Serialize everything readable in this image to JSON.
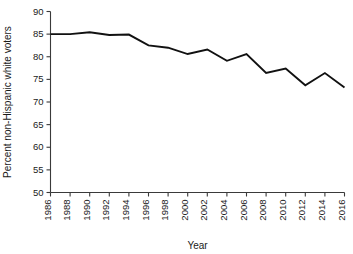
{
  "chart_data": {
    "type": "line",
    "title": "",
    "subtitle": "",
    "xlabel": "Year",
    "ylabel": "Percent non-Hispanic white voters",
    "xlim": [
      1986,
      2016
    ],
    "ylim": [
      50,
      90
    ],
    "grid": false,
    "legend": null,
    "legend_position": "none",
    "x_tick_labels": [
      "1986",
      "1988",
      "1990",
      "1992",
      "1994",
      "1996",
      "1998",
      "2000",
      "2002",
      "2004",
      "2006",
      "2008",
      "2010",
      "2012",
      "2014",
      "2016"
    ],
    "y_tick_labels": [
      "50",
      "55",
      "60",
      "65",
      "70",
      "75",
      "80",
      "85",
      "90"
    ],
    "x_ticks": [
      1986,
      1988,
      1990,
      1992,
      1994,
      1996,
      1998,
      2000,
      2002,
      2004,
      2006,
      2008,
      2010,
      2012,
      2014,
      2016
    ],
    "y_ticks": [
      50,
      55,
      60,
      65,
      70,
      75,
      80,
      85,
      90
    ],
    "series": [
      {
        "name": "Percent non-Hispanic white voters",
        "color": "#111111",
        "x": [
          1986,
          1988,
          1990,
          1992,
          1994,
          1996,
          1998,
          2000,
          2002,
          2004,
          2006,
          2008,
          2010,
          2012,
          2014,
          2016
        ],
        "values": [
          85.0,
          85.0,
          85.4,
          84.8,
          84.9,
          82.5,
          82.0,
          80.6,
          81.6,
          79.1,
          80.6,
          76.4,
          77.4,
          73.7,
          76.4,
          73.2
        ]
      }
    ],
    "annotations": []
  }
}
